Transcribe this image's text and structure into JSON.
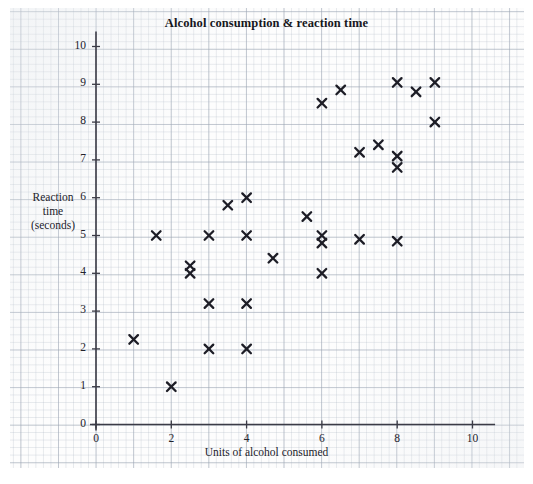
{
  "chart_data": {
    "type": "scatter",
    "title": "Alcohol consumption & reaction time",
    "xlabel": "Units of alcohol consumed",
    "ylabel": "Reaction time (seconds)",
    "ylabel_lines": [
      "Reaction",
      "time",
      "(seconds)"
    ],
    "xlim": [
      0,
      10.6
    ],
    "ylim": [
      0,
      10.4
    ],
    "xticks": [
      0,
      2,
      4,
      6,
      8,
      10
    ],
    "yticks": [
      0,
      1,
      2,
      3,
      4,
      5,
      6,
      7,
      8,
      9,
      10
    ],
    "xtick_labels": [
      "0",
      "2",
      "4",
      "6",
      "8",
      "10"
    ],
    "ytick_labels": [
      "0",
      "1",
      "2",
      "3",
      "4",
      "5",
      "6",
      "7",
      "8",
      "9",
      "10"
    ],
    "grid": true,
    "grid_minor_step": 0.2,
    "grid_major_step": 1,
    "legend": null,
    "marker": "x-cross",
    "marker_color": "#1d1d26",
    "points": [
      {
        "x": 1.0,
        "y": 2.25
      },
      {
        "x": 1.6,
        "y": 5.0
      },
      {
        "x": 2.0,
        "y": 1.0
      },
      {
        "x": 2.5,
        "y": 4.2
      },
      {
        "x": 2.5,
        "y": 4.0
      },
      {
        "x": 3.0,
        "y": 5.0
      },
      {
        "x": 3.0,
        "y": 3.2
      },
      {
        "x": 3.0,
        "y": 2.0
      },
      {
        "x": 3.5,
        "y": 5.8
      },
      {
        "x": 4.0,
        "y": 6.0
      },
      {
        "x": 4.0,
        "y": 5.0
      },
      {
        "x": 4.0,
        "y": 3.2
      },
      {
        "x": 4.0,
        "y": 2.0
      },
      {
        "x": 4.7,
        "y": 4.4
      },
      {
        "x": 5.6,
        "y": 5.5
      },
      {
        "x": 6.0,
        "y": 8.5
      },
      {
        "x": 6.0,
        "y": 5.0
      },
      {
        "x": 6.0,
        "y": 4.8
      },
      {
        "x": 6.0,
        "y": 4.0
      },
      {
        "x": 6.5,
        "y": 8.85
      },
      {
        "x": 7.0,
        "y": 7.2
      },
      {
        "x": 7.0,
        "y": 4.9
      },
      {
        "x": 7.5,
        "y": 7.4
      },
      {
        "x": 8.0,
        "y": 9.05
      },
      {
        "x": 8.0,
        "y": 7.1
      },
      {
        "x": 8.0,
        "y": 6.8
      },
      {
        "x": 8.0,
        "y": 4.85
      },
      {
        "x": 8.5,
        "y": 8.8
      },
      {
        "x": 9.0,
        "y": 9.05
      },
      {
        "x": 9.0,
        "y": 8.0
      }
    ]
  },
  "colors": {
    "axis": "#3b3b46",
    "marker": "#1d1d26",
    "grid_major": "#96a0af",
    "grid_minor": "#afb9c6",
    "text": "#22222b",
    "paper": "#fdfdfd"
  }
}
